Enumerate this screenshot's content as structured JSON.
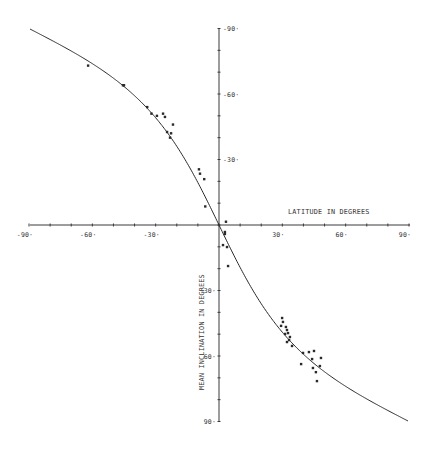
{
  "chart_data": {
    "type": "scatter",
    "title": "",
    "xlabel": "LATITUDE IN DEGREES",
    "ylabel": "MEAN INCLINATION IN DEGREES",
    "xlim": [
      -90,
      90
    ],
    "ylim": [
      -90,
      90
    ],
    "y_inverted": true,
    "grid": false,
    "legend": null,
    "x_ticks": [
      -90,
      -60,
      -30,
      30,
      60,
      90
    ],
    "x_tick_labels": [
      "-90",
      "-60",
      "-30",
      "30",
      "60",
      "90"
    ],
    "y_ticks": [
      -90,
      -60,
      -30,
      30,
      60,
      90
    ],
    "y_tick_labels": [
      "-90",
      "-60",
      "-30",
      "30",
      "60",
      "90"
    ],
    "minor_tick_step": 10,
    "series": [
      {
        "name": "observed",
        "type": "scatter",
        "marker": "x",
        "points": [
          [
            -62,
            -73
          ],
          [
            -45.5,
            -64
          ],
          [
            -45,
            -64
          ],
          [
            -34,
            -54
          ],
          [
            -32,
            -51
          ],
          [
            -29.4,
            -50
          ],
          [
            -26.5,
            -51
          ],
          [
            -25.6,
            -49.5
          ],
          [
            -21.8,
            -46
          ],
          [
            -24.6,
            -42.6
          ],
          [
            -22.7,
            -42
          ],
          [
            -23.2,
            -40
          ],
          [
            -9.5,
            -25.5
          ],
          [
            -9,
            -23.5
          ],
          [
            -7,
            -21
          ],
          [
            -6.5,
            -8.5
          ],
          [
            3.3,
            -1.5
          ],
          [
            2.8,
            3.2
          ],
          [
            2.8,
            4.1
          ],
          [
            1.9,
            9.2
          ],
          [
            3.8,
            10.1
          ],
          [
            4.3,
            18.8
          ],
          [
            29.9,
            42.6
          ],
          [
            30.3,
            44.4
          ],
          [
            29.4,
            46.2
          ],
          [
            31.7,
            46.7
          ],
          [
            32.2,
            48.1
          ],
          [
            31.3,
            49.9
          ],
          [
            32.7,
            49.5
          ],
          [
            33.6,
            51.3
          ],
          [
            33.2,
            52.7
          ],
          [
            32.2,
            53.6
          ],
          [
            34.6,
            55.4
          ],
          [
            39.8,
            58.6
          ],
          [
            42.6,
            58.2
          ],
          [
            45,
            57.7
          ],
          [
            38.9,
            63.7
          ],
          [
            44.1,
            61.4
          ],
          [
            48.3,
            60.9
          ],
          [
            47.8,
            64.6
          ],
          [
            44.5,
            65.5
          ],
          [
            46.4,
            71.5
          ],
          [
            45.9,
            67.4
          ]
        ]
      },
      {
        "name": "dipole model tan(I) = 2 tan(latitude)",
        "type": "line",
        "x_range": [
          -90,
          90
        ]
      }
    ]
  }
}
